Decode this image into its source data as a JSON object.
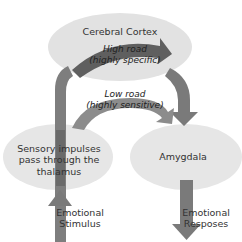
{
  "diagram": {
    "nodes": {
      "cortex": {
        "label": "Cerebral Cortex"
      },
      "thalamus": {
        "label_lines": [
          "Sensory impulses",
          "pass through the",
          "thalamus"
        ]
      },
      "amygdala": {
        "label": "Amygdala"
      }
    },
    "paths": {
      "high_road": {
        "line1": "High road",
        "line2": "(highly specific)"
      },
      "low_road": {
        "line1": "Low road",
        "line2": "(highly sensitive)"
      }
    },
    "input": {
      "line1": "Emotional",
      "line2": "Stimulus"
    },
    "output": {
      "line1": "Emotional",
      "line2": "Resposes"
    },
    "colors": {
      "ellipse_fill": "#e4e4e4",
      "arrow_dark": "#6f6f6f",
      "arrow_mid": "#8a8a8a",
      "text": "#333333"
    }
  }
}
